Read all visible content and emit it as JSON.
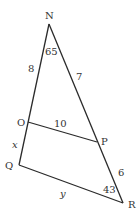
{
  "diagram": {
    "vertices": {
      "N": {
        "label": "N",
        "x": 49,
        "y": 24
      },
      "O": {
        "label": "O",
        "x": 28,
        "y": 122
      },
      "Q": {
        "label": "Q",
        "x": 19,
        "y": 165
      },
      "P": {
        "label": "P",
        "x": 97,
        "y": 142
      },
      "R": {
        "label": "R",
        "x": 123,
        "y": 203
      }
    },
    "segments": [
      {
        "from": "N",
        "to": "Q"
      },
      {
        "from": "N",
        "to": "R"
      },
      {
        "from": "O",
        "to": "P"
      },
      {
        "from": "Q",
        "to": "R"
      }
    ],
    "labels": {
      "NO": "8",
      "NP": "7",
      "OP": "10",
      "OQ": "x",
      "PR": "6",
      "QR": "y",
      "angle_N": "65",
      "angle_R": "43"
    },
    "colors": {
      "line": "#2a2a2a",
      "text": "#333333"
    }
  }
}
